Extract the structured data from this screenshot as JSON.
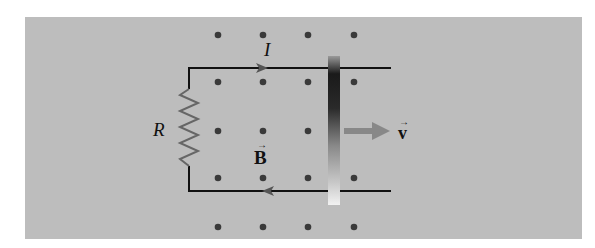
{
  "figure": {
    "background_color": "#bdbdbd",
    "labels": {
      "current": "I",
      "resistor": "R",
      "field": "B",
      "velocity": "v"
    },
    "field_direction": "out-of-page",
    "field_dots": {
      "columns_x": [
        218,
        263,
        308,
        354
      ],
      "rows_y": [
        35,
        82,
        131,
        178,
        227
      ]
    },
    "current_arrow_top": "right",
    "current_arrow_bottom": "left",
    "velocity_direction": "right",
    "colors": {
      "wire": "#111111",
      "resistor": "#666666",
      "dot": "#3a3a3a",
      "velocity_arrow": "#888888"
    }
  }
}
